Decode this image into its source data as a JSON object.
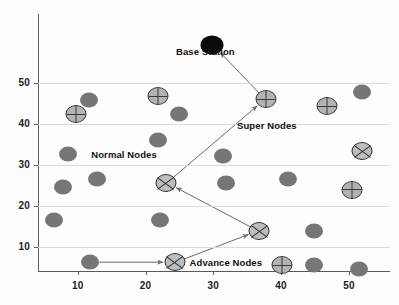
{
  "chart_data": {
    "type": "scatter",
    "title": "",
    "subtitle": "",
    "xlabel": "",
    "ylabel": "",
    "xlim": [
      3,
      54
    ],
    "ylim": [
      3,
      58
    ],
    "grid": true,
    "grid_axis": "y",
    "legend_position": "inline-annotations",
    "xticks": [
      10,
      20,
      30,
      40,
      50
    ],
    "yticks": [
      10,
      20,
      30,
      40,
      50
    ],
    "xtick_labels": [
      "10",
      "20",
      "30",
      "40",
      "50"
    ],
    "ytick_labels": [
      "10",
      "20",
      "30",
      "40",
      "50"
    ],
    "annotations": [
      {
        "text": "Base Station",
        "x": 24.5,
        "y": 57.5
      },
      {
        "text": "Super Nodes",
        "x": 33.5,
        "y": 39.5
      },
      {
        "text": "Normal Nodes",
        "x": 12.0,
        "y": 32.5
      },
      {
        "text": "Advance Nodes",
        "x": 26.5,
        "y": 6.2
      }
    ],
    "series": [
      {
        "name": "Normal Nodes",
        "marker": "filled-circle",
        "color": "#767676",
        "points": [
          {
            "x": 11.7,
            "y": 45.8
          },
          {
            "x": 25.0,
            "y": 42.4
          },
          {
            "x": 52.0,
            "y": 47.8
          },
          {
            "x": 21.8,
            "y": 36.2
          },
          {
            "x": 8.5,
            "y": 32.8
          },
          {
            "x": 31.5,
            "y": 32.2
          },
          {
            "x": 7.8,
            "y": 24.6
          },
          {
            "x": 12.8,
            "y": 26.6
          },
          {
            "x": 31.8,
            "y": 25.6
          },
          {
            "x": 41.0,
            "y": 26.6
          },
          {
            "x": 6.5,
            "y": 16.5
          },
          {
            "x": 22.2,
            "y": 16.5
          },
          {
            "x": 44.8,
            "y": 13.9
          },
          {
            "x": 11.8,
            "y": 6.3
          },
          {
            "x": 44.8,
            "y": 5.5
          },
          {
            "x": 51.5,
            "y": 4.7
          }
        ]
      },
      {
        "name": "Super Nodes",
        "marker": "circle-plus",
        "color": "#b3b3b3",
        "points": [
          {
            "x": 9.8,
            "y": 42.4
          },
          {
            "x": 21.8,
            "y": 46.8
          },
          {
            "x": 37.8,
            "y": 46.0
          },
          {
            "x": 46.8,
            "y": 44.3
          },
          {
            "x": 50.5,
            "y": 24.0
          },
          {
            "x": 40.2,
            "y": 5.5
          }
        ]
      },
      {
        "name": "Advance Nodes",
        "marker": "circle-cross",
        "color": "#bdbdbd",
        "points": [
          {
            "x": 52.0,
            "y": 33.3
          },
          {
            "x": 23.0,
            "y": 25.6
          },
          {
            "x": 36.8,
            "y": 13.9
          },
          {
            "x": 24.3,
            "y": 6.3
          }
        ]
      },
      {
        "name": "Base Station",
        "marker": "filled-circle-black",
        "color": "#0b0b0b",
        "points": [
          {
            "x": 29.8,
            "y": 59.2
          }
        ]
      }
    ],
    "links": [
      {
        "from": {
          "x": 11.8,
          "y": 6.3
        },
        "to": {
          "x": 24.3,
          "y": 6.3
        }
      },
      {
        "from": {
          "x": 24.3,
          "y": 6.3
        },
        "to": {
          "x": 36.8,
          "y": 13.9
        }
      },
      {
        "from": {
          "x": 36.8,
          "y": 13.9
        },
        "to": {
          "x": 23.0,
          "y": 25.6
        }
      },
      {
        "from": {
          "x": 23.0,
          "y": 25.6
        },
        "to": {
          "x": 37.8,
          "y": 46.0
        }
      },
      {
        "from": {
          "x": 37.8,
          "y": 46.0
        },
        "to": {
          "x": 29.8,
          "y": 59.2
        }
      }
    ]
  }
}
